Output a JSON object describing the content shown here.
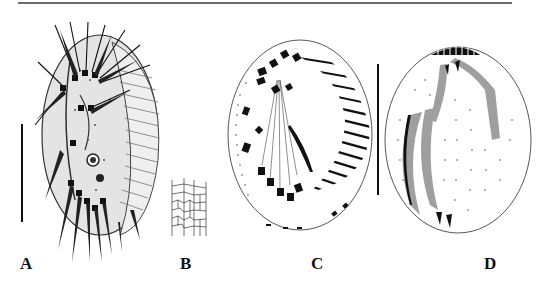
{
  "figure": {
    "panels": [
      {
        "id": "A",
        "label": "A",
        "description": "Ciliate cell, ventral view with cirri and adoral zone"
      },
      {
        "id": "B",
        "label": "B",
        "description": "Cortical pattern / silverline network detail"
      },
      {
        "id": "C",
        "label": "C",
        "description": "Infraciliature, ventral side with cirri and adoral membranelles"
      },
      {
        "id": "D",
        "label": "D",
        "description": "Infraciliature, dorsal side with kineties and stippled structures"
      }
    ],
    "scale_bars": [
      {
        "panel": "A",
        "orientation": "vertical"
      },
      {
        "panel": "C/D",
        "orientation": "vertical"
      }
    ],
    "colors": {
      "ink": "#111111",
      "rule": "#6b6b6b",
      "background": "#ffffff"
    }
  }
}
